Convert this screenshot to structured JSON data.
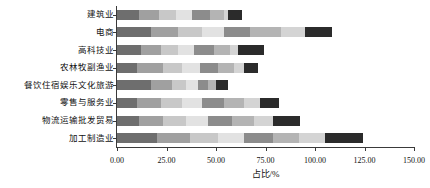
{
  "chart_data": {
    "type": "bar",
    "orientation": "horizontal",
    "stacked": true,
    "title": "",
    "xlabel": "占比/%",
    "ylabel": "",
    "xlim": [
      0,
      150
    ],
    "xticks": [
      0,
      25,
      50,
      75,
      100,
      125,
      150
    ],
    "xtick_labels": [
      "0.00",
      "25.00",
      "50.00",
      "75.00",
      "100.00",
      "125.00",
      "150.00"
    ],
    "grid": false,
    "legend": "none",
    "categories": [
      "建筑业",
      "电商",
      "高科技业",
      "农林牧副渔业",
      "餐饮住宿娱乐文化旅游",
      "零售与服务业",
      "物流运输批发贸易",
      "加工制造业"
    ],
    "totals": [
      63.0,
      108.5,
      74.5,
      71.0,
      56.0,
      82.0,
      92.5,
      124.5
    ],
    "series": [
      {
        "name": "seg1",
        "color": "#6e6e6e",
        "values": [
          11.0,
          17.0,
          12.0,
          10.0,
          17.0,
          10.0,
          11.0,
          20.0
        ]
      },
      {
        "name": "seg2",
        "color": "#a0a0a0",
        "values": [
          10.0,
          14.0,
          10.0,
          13.0,
          11.0,
          12.0,
          12.0,
          17.0
        ]
      },
      {
        "name": "seg3",
        "color": "#c8c8c8",
        "values": [
          9.0,
          12.0,
          9.0,
          10.0,
          7.0,
          11.0,
          12.0,
          14.0
        ]
      },
      {
        "name": "seg4",
        "color": "#e2e2e2",
        "values": [
          8.0,
          11.0,
          8.0,
          9.0,
          6.0,
          10.0,
          11.0,
          13.0
        ]
      },
      {
        "name": "seg5",
        "color": "#8c8c8c",
        "values": [
          9.0,
          13.0,
          10.0,
          9.0,
          5.0,
          11.0,
          12.0,
          15.0
        ]
      },
      {
        "name": "seg6",
        "color": "#b4b4b4",
        "values": [
          7.0,
          16.0,
          8.0,
          8.0,
          4.0,
          10.0,
          11.0,
          13.0
        ]
      },
      {
        "name": "seg7",
        "color": "#d4d4d4",
        "values": [
          2.0,
          12.0,
          4.0,
          5.0,
          0.0,
          8.0,
          10.0,
          13.0
        ]
      },
      {
        "name": "seg8",
        "color": "#2b2b2b",
        "values": [
          7.0,
          13.5,
          13.5,
          7.0,
          6.0,
          10.0,
          13.5,
          19.5
        ]
      }
    ]
  },
  "axis": {
    "x_title": "占比/%"
  }
}
